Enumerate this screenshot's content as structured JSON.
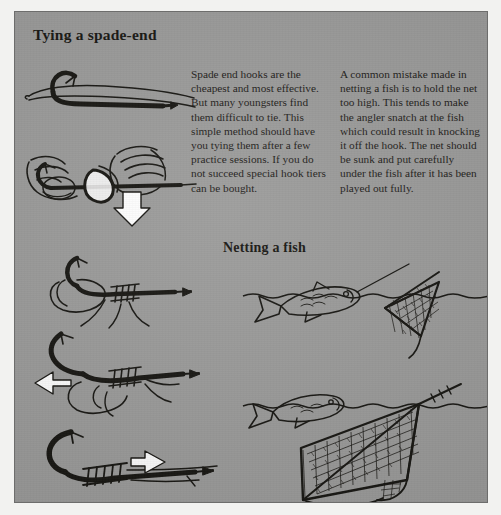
{
  "page": {
    "background_color": "#ffffff",
    "panel_color": "#9a9a99",
    "ink_color": "#14130f",
    "arrow_color": "#ffffff"
  },
  "headings": {
    "main": "Tying a spade-end",
    "netting": "Netting a fish"
  },
  "columns": {
    "left": "Spade end hooks are the cheapest and most effective. But many youngsters find them difficult to tie. This simple method should have you tying them after a few practice sessions. If you do not succeed special hook tiers can be bought.",
    "right": "A common mistake made in netting a fish is to hold the net too high. This tends to make the angler snatch at the fish which could result in knocking it off the hook. The net should be sunk and put carefully under the fish after it has been played out fully."
  },
  "illustrations": [
    {
      "name": "spade-end-hook-with-line",
      "caption": ""
    },
    {
      "name": "hands-tying-whip-knot",
      "caption": ""
    },
    {
      "name": "hook-with-loop-and-coils",
      "caption": ""
    },
    {
      "name": "hook-tightening-knot",
      "caption": ""
    },
    {
      "name": "finished-whipped-hook",
      "caption": ""
    },
    {
      "name": "fish-with-net-held-too-high",
      "caption": ""
    },
    {
      "name": "fish-with-net-sunk-correctly",
      "caption": ""
    }
  ]
}
